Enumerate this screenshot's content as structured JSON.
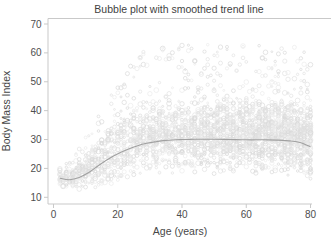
{
  "colors": {
    "background": "#ffffff",
    "title_text": "#3f3f3f",
    "axis_label_text": "#474747",
    "tick_label_text": "#4e4e4e",
    "axis_line": "#c9c9c9",
    "trend_line": "#a0a0a0",
    "bubble_strokes": [
      "#e2e2e2",
      "#dadada",
      "#ebebeb"
    ]
  },
  "chart_data": {
    "type": "bubble",
    "title": "Bubble plot with smoothed trend line",
    "xlabel": "Age (years)",
    "ylabel": "Body Mass Index",
    "x_ticks": [
      0,
      20,
      40,
      60,
      80
    ],
    "y_ticks": [
      10,
      20,
      30,
      40,
      50,
      60,
      70
    ],
    "xlim": [
      0,
      80
    ],
    "ylim": [
      10,
      70
    ],
    "grid": "off",
    "legend": "none",
    "trend": {
      "x": [
        2,
        5,
        8,
        11,
        14,
        17,
        20,
        23,
        26,
        29,
        32,
        35,
        38,
        41,
        44,
        47,
        50,
        55,
        60,
        65,
        70,
        74,
        77,
        80
      ],
      "y": [
        16.6,
        16.1,
        16.9,
        18.6,
        21.0,
        23.2,
        25.1,
        26.6,
        27.8,
        28.7,
        29.3,
        29.7,
        29.9,
        30.0,
        30.1,
        30.1,
        30.1,
        30.0,
        29.9,
        29.9,
        29.8,
        29.5,
        28.9,
        27.5
      ]
    },
    "bubble_cloud": {
      "description": "Faint gray outlined bubbles stacked in vertical columns at each integer age; spread of BMI widens with age, dense band roughly 13-46 with sparse outliers up to ~65.",
      "age_min": 2,
      "age_max": 80,
      "seed": 42,
      "count_base": 12,
      "count_per_year": 0.5,
      "count_jitter": 8,
      "low_offset_base": 3,
      "low_offset_per_year": 0.38,
      "low_offset_cap": 12.5,
      "bmi_floor": 12.5,
      "high_offset_base": 1,
      "high_offset_per_year": 0.75,
      "high_offset_cap": 16,
      "outlier_offset_base": 2,
      "outlier_offset_per_year": 1.1,
      "outlier_offset_cap": 33,
      "outlier_rate": 0.07,
      "bmi_ceiling": 66,
      "radius_min": 0.9,
      "radius_span": 1.5
    }
  }
}
